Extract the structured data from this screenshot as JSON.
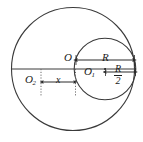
{
  "figure": {
    "background_color": "#ffffff",
    "stroke_color": "#3a3a3a",
    "text_color": "#1a1a1a",
    "labels": {
      "center_O": "O",
      "center_O1_base": "O",
      "center_O1_sub": "1",
      "center_O2_base": "O",
      "center_O2_sub": "2",
      "radius_R": "R",
      "distance_x": "x",
      "half_radius_numerator": "R",
      "half_radius_denominator": "2"
    },
    "shapes": {
      "large_circle": {
        "cx": 73,
        "cy": 69,
        "r": 62
      },
      "small_circle": {
        "cx": 105,
        "cy": 69,
        "r": 31
      },
      "diameter_line": {
        "x1": 11,
        "y1": 69,
        "x2": 136,
        "y2": 69
      },
      "dotted_line_left": {
        "x": 41,
        "y1": 69,
        "y2": 96
      },
      "dotted_line_right": {
        "x": 75,
        "y1": 69,
        "y2": 96
      },
      "center_dot_O1": {
        "cx": 105,
        "cy": 69,
        "r": 1
      }
    },
    "dimension_arrows": [
      {
        "name": "R",
        "x1": 76,
        "x2": 134,
        "y": 60,
        "double_headed": true
      },
      {
        "name": "R/2",
        "x1": 105,
        "x2": 136,
        "y": 72,
        "double_headed": true
      },
      {
        "name": "x",
        "x1": 42,
        "x2": 75,
        "y": 82,
        "double_headed": true
      }
    ]
  }
}
